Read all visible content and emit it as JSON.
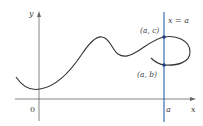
{
  "diagram": {
    "axes": {
      "x_label": "x",
      "y_label": "y",
      "origin_label": "0",
      "x_tick_label": "a"
    },
    "vertical_line": {
      "label": "x = a",
      "color": "#2a5fa8"
    },
    "points": [
      {
        "label": "(a, c)"
      },
      {
        "label": "(a, b)"
      }
    ],
    "colors": {
      "curve": "#333333",
      "axes": "#555555",
      "vertical_line": "#2a5fa8",
      "points": "#1f3f80"
    }
  }
}
